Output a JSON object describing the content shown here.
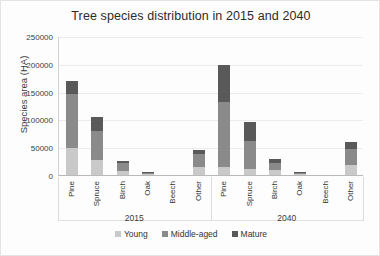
{
  "chart_data": {
    "type": "bar",
    "stacked": true,
    "title": "Tree species distribution in 2015 and 2040",
    "xlabel": "",
    "ylabel": "Species area (HA)",
    "ylim": [
      0,
      250000
    ],
    "yticks": [
      0,
      50000,
      100000,
      150000,
      200000,
      250000
    ],
    "ytick_labels": [
      "0",
      "50000",
      "100000",
      "150000",
      "200000",
      "250000"
    ],
    "grid": true,
    "legend_position": "bottom",
    "groups": [
      "2015",
      "2040"
    ],
    "categories": [
      "Pine",
      "Spruce",
      "Birch",
      "Oak",
      "Beech",
      "Other"
    ],
    "series": [
      {
        "name": "Young",
        "color": "#c9c9c9",
        "values_2015": [
          48000,
          27000,
          8000,
          1000,
          0,
          14000
        ],
        "values_2040": [
          15000,
          10000,
          9000,
          500,
          0,
          18000
        ]
      },
      {
        "name": "Middle-aged",
        "color": "#8a8a8a",
        "values_2015": [
          97000,
          52000,
          14000,
          1500,
          0,
          23000
        ],
        "values_2040": [
          117000,
          52000,
          13000,
          1000,
          0,
          29000
        ]
      },
      {
        "name": "Mature",
        "color": "#595959",
        "values_2015": [
          25000,
          26000,
          3000,
          500,
          0,
          8000
        ],
        "values_2040": [
          66000,
          33000,
          6000,
          500,
          0,
          13000
        ]
      }
    ],
    "totals_2015": [
      170000,
      105000,
      25000,
      3000,
      0,
      45000
    ],
    "totals_2040": [
      198000,
      95000,
      28000,
      2000,
      0,
      60000
    ]
  },
  "legend": {
    "items": [
      {
        "label": "Young"
      },
      {
        "label": "Middle-aged"
      },
      {
        "label": "Mature"
      }
    ]
  }
}
